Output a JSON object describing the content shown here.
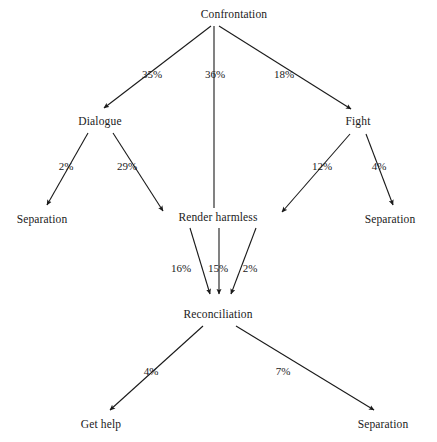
{
  "diagram": {
    "type": "flowchart",
    "background_color": "#ffffff",
    "stroke_color": "#1a1a1a",
    "nodes": [
      {
        "id": "confrontation",
        "label": "Confrontation",
        "x": 234,
        "y": 15
      },
      {
        "id": "dialogue",
        "label": "Dialogue",
        "x": 100,
        "y": 122
      },
      {
        "id": "fight",
        "label": "Fight",
        "x": 358,
        "y": 122
      },
      {
        "id": "separation_left",
        "label": "Separation",
        "x": 42,
        "y": 220
      },
      {
        "id": "render_harmless",
        "label": "Render harmless",
        "x": 218,
        "y": 218
      },
      {
        "id": "separation_right",
        "label": "Separation",
        "x": 390,
        "y": 220
      },
      {
        "id": "reconciliation",
        "label": "Reconciliation",
        "x": 218,
        "y": 315
      },
      {
        "id": "get_help",
        "label": "Get help",
        "x": 101,
        "y": 425
      },
      {
        "id": "separation_bottom",
        "label": "Separation",
        "x": 383,
        "y": 425
      }
    ],
    "edges": [
      {
        "from": "confrontation",
        "to": "dialogue",
        "label": "35%",
        "label_x": 152,
        "label_y": 74,
        "arrow": true
      },
      {
        "from": "confrontation",
        "to": "render_harmless",
        "label": "36%",
        "label_x": 215,
        "label_y": 74,
        "arrow": false
      },
      {
        "from": "confrontation",
        "to": "fight",
        "label": "18%",
        "label_x": 284,
        "label_y": 74,
        "arrow": true
      },
      {
        "from": "dialogue",
        "to": "separation_left",
        "label": "2%",
        "label_x": 66,
        "label_y": 166,
        "arrow": true
      },
      {
        "from": "dialogue",
        "to": "render_harmless",
        "label": "29%",
        "label_x": 127,
        "label_y": 166,
        "arrow": true
      },
      {
        "from": "fight",
        "to": "render_harmless",
        "label": "12%",
        "label_x": 322,
        "label_y": 166,
        "arrow": true
      },
      {
        "from": "fight",
        "to": "separation_right",
        "label": "4%",
        "label_x": 379,
        "label_y": 166,
        "arrow": true
      },
      {
        "from": "render_harmless",
        "to": "reconciliation",
        "label": "16%",
        "label_x": 181,
        "label_y": 268,
        "arrow": true
      },
      {
        "from": "render_harmless",
        "to": "reconciliation",
        "label": "15%",
        "label_x": 218,
        "label_y": 268,
        "arrow": true
      },
      {
        "from": "render_harmless",
        "to": "reconciliation",
        "label": "2%",
        "label_x": 250,
        "label_y": 268,
        "arrow": true
      },
      {
        "from": "reconciliation",
        "to": "get_help",
        "label": "4%",
        "label_x": 151,
        "label_y": 371,
        "arrow": true
      },
      {
        "from": "reconciliation",
        "to": "separation_bottom",
        "label": "7%",
        "label_x": 283,
        "label_y": 371,
        "arrow": true
      }
    ]
  }
}
